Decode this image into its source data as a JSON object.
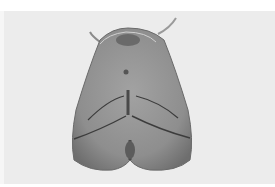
{
  "image": {
    "subject": "moth specimen, dorsal view, wings folded",
    "style": "grayscale photograph",
    "colors": {
      "page_background": "#ffffff",
      "photo_background": "#ececec",
      "wing_base": "#8f8f8f",
      "wing_dark": "#5a5a5a",
      "wing_line": "#3c3c3c"
    }
  }
}
